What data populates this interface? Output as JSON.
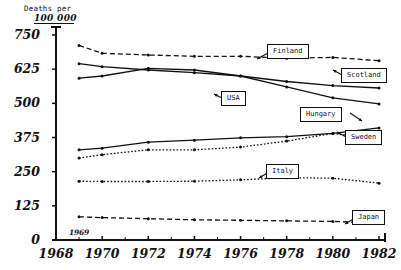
{
  "chart_data": {
    "type": "line",
    "title": "",
    "ylabel_line1": "Deaths per",
    "ylabel_line2": "100 000",
    "xlabel": "",
    "ylim": [
      0,
      750
    ],
    "xlim": [
      1968,
      1982
    ],
    "grid": false,
    "legend_position": "inline-callouts",
    "ytick_labels": [
      "750",
      "625",
      "500",
      "375",
      "250",
      "125",
      "0"
    ],
    "yticks": [
      750,
      625,
      500,
      375,
      250,
      125,
      0
    ],
    "xtick_labels": [
      "1968",
      "1970",
      "1972",
      "1974",
      "1976",
      "1978",
      "1980",
      "1982"
    ],
    "xticks": [
      1968,
      1970,
      1972,
      1974,
      1976,
      1978,
      1980,
      1982
    ],
    "annotations": [
      {
        "text": "1969",
        "x": 1969,
        "note": "start-year marker above axis"
      }
    ],
    "x": [
      1969,
      1970,
      1972,
      1974,
      1976,
      1978,
      1980,
      1982
    ],
    "series": [
      {
        "name": "Finland",
        "label": "Finland",
        "style": "dashed",
        "values": [
          712,
          683,
          677,
          672,
          672,
          665,
          668,
          656
        ]
      },
      {
        "name": "Scotland",
        "label": "Scotland",
        "style": "solid",
        "values": [
          645,
          634,
          622,
          612,
          600,
          580,
          565,
          556
        ]
      },
      {
        "name": "USA",
        "label": "USA",
        "style": "solid",
        "values": [
          592,
          600,
          628,
          622,
          600,
          560,
          520,
          498
        ]
      },
      {
        "name": "Hungary",
        "label": "Hungary",
        "style": "solid",
        "values": [
          330,
          336,
          358,
          365,
          374,
          378,
          390,
          410
        ]
      },
      {
        "name": "Sweden",
        "label": "Sweden",
        "style": "dotted",
        "values": [
          300,
          312,
          330,
          330,
          340,
          362,
          390,
          368
        ]
      },
      {
        "name": "Italy",
        "label": "Italy",
        "style": "dotted",
        "values": [
          215,
          214,
          214,
          215,
          220,
          228,
          226,
          208
        ]
      },
      {
        "name": "Japan",
        "label": "Japan",
        "style": "dashed",
        "values": [
          85,
          82,
          78,
          74,
          72,
          70,
          68,
          62
        ]
      }
    ]
  },
  "callouts": {
    "finland": "Finland",
    "scotland": "Scotland",
    "usa": "USA",
    "hungary": "Hungary",
    "sweden": "Sweden",
    "italy": "Italy",
    "japan": "Japan"
  }
}
